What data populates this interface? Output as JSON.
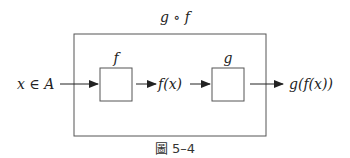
{
  "diagram": {
    "title": "g ∘ f",
    "input_label": "x ∈ A",
    "boxes": [
      {
        "label": "f"
      },
      {
        "label": "g"
      }
    ],
    "intermediate_label": "f(x)",
    "output_label": "g(f(x))",
    "caption": "圖 5–4",
    "colors": {
      "stroke": "#555555",
      "text": "#222222",
      "background": "#ffffff"
    }
  }
}
